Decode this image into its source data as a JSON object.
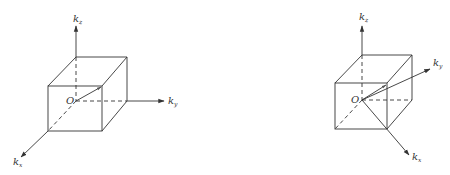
{
  "diagrams": [
    {
      "id": "left",
      "origin_label": "O",
      "axes": {
        "kz": {
          "base": "k",
          "sub": "z"
        },
        "ky": {
          "base": "k",
          "sub": "y"
        },
        "kx": {
          "base": "k",
          "sub": "x"
        }
      },
      "description": "Cube in k-space with axes aligned to cube edges; vector from O to front top-right corner"
    },
    {
      "id": "right",
      "origin_label": "O",
      "axes": {
        "kz": {
          "base": "k",
          "sub": "z"
        },
        "ky": {
          "base": "k",
          "sub": "y"
        },
        "kx": {
          "base": "k",
          "sub": "x"
        }
      },
      "description": "Same cube with kx and ky axes rotated 45° toward cube corners"
    }
  ],
  "colors": {
    "line": "#333333",
    "background": "#ffffff"
  }
}
